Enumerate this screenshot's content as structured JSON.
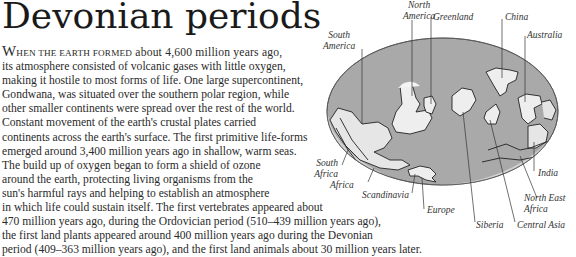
{
  "title": "Devonian periods",
  "paragraph": {
    "lead_initial": "W",
    "lead_smallcaps": "HEN THE EARTH FORMED",
    "lines": [
      " about 4,600 million years ago,",
      "its atmosphere consisted of volcanic gases with little oxygen,",
      "making it hostile to most forms of life. One large supercontinent,",
      "Gondwana, was situated over the southern polar region, while",
      "other smaller continents were spread over the rest of the world.",
      "Constant movement of the earth's crustal plates carried",
      "continents across the earth's surface. The first primitive life-forms",
      "emerged around 3,400 million years ago in shallow, warm seas.",
      "The build up of oxygen began to form a shield of ozone",
      "around the earth, protecting living organisms from the",
      "sun's harmful rays and helping to establish an atmosphere",
      "in which life could sustain itself. The first vertebrates appeared about",
      "470 million years ago, during the Ordovician period (510–439 million years ago),",
      "the first land plants appeared around 400 million years ago during the Devonian",
      "period (409–363 million years ago), and the first land animals about 30 million years later."
    ]
  },
  "map": {
    "ocean_color": "#a9a9a9",
    "land_color": "#eeeeee",
    "shelf_color": "#d2d2d2",
    "labels": {
      "north_america": [
        "North",
        "America"
      ],
      "greenland": "Greenland",
      "china": "China",
      "south_america": [
        "South",
        "America"
      ],
      "australia": "Australia",
      "south_africa": [
        "South",
        "Africa"
      ],
      "africa": "Africa",
      "scandinavia": "Scandinavia",
      "europe": "Europe",
      "siberia": "Siberia",
      "central_asia": "Central Asia",
      "india": "India",
      "north_east_africa": [
        "North East",
        "Africa"
      ]
    }
  }
}
